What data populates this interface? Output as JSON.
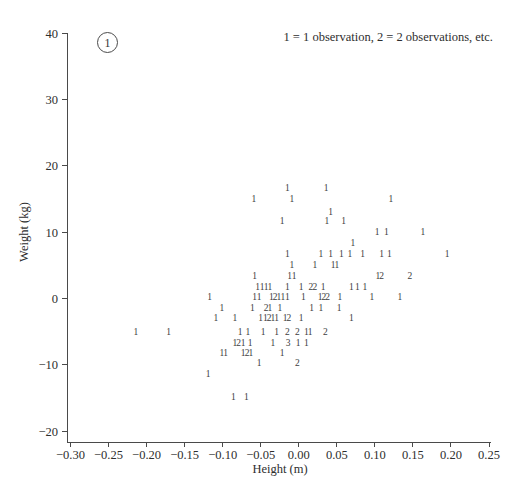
{
  "figure": {
    "background": "#ffffff",
    "ink_color": "#3d3d3d",
    "axis_color": "#4a4a4a",
    "annotation": {
      "circled_label": "1"
    },
    "note": "1 = 1 observation, 2 = 2 observations, etc."
  },
  "chart_data": {
    "type": "scatter",
    "glyph_encoding": "digit shows number of observations at that position",
    "title": "",
    "xlabel": "Height (m)",
    "ylabel": "Weight (kg)",
    "xlim": [
      -0.3,
      0.25
    ],
    "ylim": [
      -20,
      40
    ],
    "grid": false,
    "legend_position": "top-right",
    "xticks": [
      -0.3,
      -0.25,
      -0.2,
      -0.15,
      -0.1,
      -0.05,
      0.0,
      0.05,
      0.1,
      0.15,
      0.2,
      0.25
    ],
    "xtick_labels": [
      "−0.30",
      "−0.25",
      "−0.20",
      "−0.15",
      "−0.10",
      "−0.05",
      "0.00",
      "0.05",
      "0.10",
      "0.15",
      "0.20",
      "0.25"
    ],
    "yticks": [
      40,
      30,
      20,
      10,
      0,
      -10,
      -20
    ],
    "ytick_labels": [
      "40",
      "30",
      "20",
      "10",
      "0",
      "−10",
      "−20"
    ],
    "points": [
      [
        -0.015,
        16.6,
        1
      ],
      [
        0.036,
        16.6,
        1
      ],
      [
        -0.059,
        15.0,
        1
      ],
      [
        -0.009,
        15.0,
        1
      ],
      [
        0.121,
        15.0,
        1
      ],
      [
        0.042,
        13.0,
        1
      ],
      [
        -0.022,
        11.7,
        1
      ],
      [
        0.037,
        11.7,
        1
      ],
      [
        0.059,
        11.7,
        1
      ],
      [
        0.103,
        10.0,
        1
      ],
      [
        0.115,
        10.0,
        1
      ],
      [
        0.163,
        10.0,
        1
      ],
      [
        0.071,
        8.3,
        1
      ],
      [
        -0.015,
        6.7,
        1
      ],
      [
        0.029,
        6.7,
        1
      ],
      [
        0.042,
        6.7,
        1
      ],
      [
        0.056,
        6.7,
        1
      ],
      [
        0.067,
        6.7,
        1
      ],
      [
        0.084,
        6.7,
        1
      ],
      [
        0.109,
        6.7,
        1
      ],
      [
        0.119,
        6.7,
        1
      ],
      [
        0.195,
        6.7,
        1
      ],
      [
        -0.009,
        5.0,
        1
      ],
      [
        0.021,
        5.0,
        1
      ],
      [
        0.045,
        5.0,
        1
      ],
      [
        0.05,
        5.0,
        1
      ],
      [
        -0.058,
        3.4,
        1
      ],
      [
        -0.012,
        3.4,
        1
      ],
      [
        -0.006,
        3.4,
        1
      ],
      [
        0.104,
        3.4,
        1
      ],
      [
        0.109,
        3.4,
        2
      ],
      [
        0.146,
        3.4,
        2
      ],
      [
        -0.054,
        1.7,
        1
      ],
      [
        -0.048,
        1.7,
        1
      ],
      [
        -0.043,
        1.7,
        1
      ],
      [
        -0.038,
        1.7,
        1
      ],
      [
        -0.015,
        1.7,
        1
      ],
      [
        0.003,
        1.7,
        1
      ],
      [
        0.016,
        1.7,
        2
      ],
      [
        0.021,
        1.7,
        2
      ],
      [
        0.032,
        1.7,
        1
      ],
      [
        0.069,
        1.7,
        1
      ],
      [
        0.077,
        1.7,
        1
      ],
      [
        0.087,
        1.7,
        1
      ],
      [
        -0.117,
        0.2,
        1
      ],
      [
        -0.058,
        0.2,
        1
      ],
      [
        -0.052,
        0.2,
        1
      ],
      [
        -0.036,
        0.2,
        1
      ],
      [
        -0.031,
        0.2,
        2
      ],
      [
        -0.026,
        0.2,
        1
      ],
      [
        -0.021,
        0.2,
        1
      ],
      [
        -0.015,
        0.2,
        1
      ],
      [
        0.006,
        0.2,
        1
      ],
      [
        0.028,
        0.2,
        1
      ],
      [
        0.033,
        0.2,
        2
      ],
      [
        0.038,
        0.2,
        2
      ],
      [
        0.054,
        0.2,
        1
      ],
      [
        0.096,
        0.2,
        1
      ],
      [
        0.133,
        0.2,
        1
      ],
      [
        -0.101,
        -1.5,
        1
      ],
      [
        -0.061,
        -1.5,
        1
      ],
      [
        -0.043,
        -1.5,
        2
      ],
      [
        -0.038,
        -1.5,
        1
      ],
      [
        -0.025,
        -1.5,
        1
      ],
      [
        0.017,
        -1.5,
        1
      ],
      [
        0.029,
        -1.5,
        1
      ],
      [
        0.053,
        -1.5,
        1
      ],
      [
        -0.109,
        -3.0,
        1
      ],
      [
        -0.084,
        -3.0,
        1
      ],
      [
        -0.05,
        -3.0,
        1
      ],
      [
        -0.044,
        -3.0,
        1
      ],
      [
        -0.039,
        -3.0,
        2
      ],
      [
        -0.034,
        -3.0,
        1
      ],
      [
        -0.029,
        -3.0,
        1
      ],
      [
        -0.018,
        -3.0,
        1
      ],
      [
        -0.013,
        -3.0,
        2
      ],
      [
        0.003,
        -3.0,
        1
      ],
      [
        0.069,
        -3.0,
        1
      ],
      [
        -0.214,
        -5.1,
        1
      ],
      [
        -0.171,
        -5.1,
        1
      ],
      [
        -0.077,
        -5.1,
        1
      ],
      [
        -0.067,
        -5.1,
        1
      ],
      [
        -0.047,
        -5.1,
        1
      ],
      [
        -0.029,
        -5.1,
        1
      ],
      [
        -0.015,
        -5.1,
        2
      ],
      [
        -0.002,
        -5.1,
        2
      ],
      [
        0.01,
        -5.1,
        1
      ],
      [
        0.015,
        -5.1,
        1
      ],
      [
        0.035,
        -5.1,
        2
      ],
      [
        -0.084,
        -6.7,
        1
      ],
      [
        -0.079,
        -6.7,
        2
      ],
      [
        -0.073,
        -6.7,
        1
      ],
      [
        -0.064,
        -6.7,
        1
      ],
      [
        -0.034,
        -6.7,
        1
      ],
      [
        -0.014,
        -6.7,
        3
      ],
      [
        -0.001,
        -6.7,
        1
      ],
      [
        0.01,
        -6.7,
        1
      ],
      [
        -0.101,
        -8.2,
        1
      ],
      [
        -0.096,
        -8.2,
        1
      ],
      [
        -0.073,
        -8.2,
        1
      ],
      [
        -0.068,
        -8.2,
        2
      ],
      [
        -0.063,
        -8.2,
        1
      ],
      [
        -0.022,
        -8.2,
        1
      ],
      [
        -0.052,
        -9.7,
        1
      ],
      [
        -0.002,
        -9.7,
        2
      ],
      [
        -0.119,
        -11.4,
        1
      ],
      [
        -0.086,
        -14.9,
        1
      ],
      [
        -0.069,
        -14.9,
        1
      ]
    ]
  }
}
